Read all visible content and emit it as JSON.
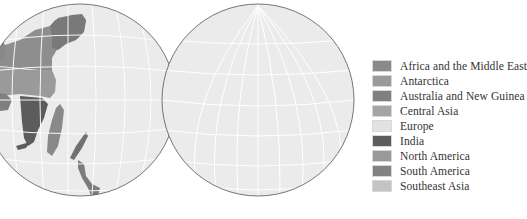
{
  "figure": {
    "left_globe": {
      "name": "Eastern hemisphere globe",
      "cx": 80,
      "cy": 100,
      "r": 96
    },
    "right_globe": {
      "name": "Western hemisphere globe",
      "cx": 258,
      "cy": 100,
      "r": 96
    },
    "globe_fill": "#ebebeb",
    "graticule_color": "#ffffff",
    "outline_color": "#555555"
  },
  "legend": {
    "items": [
      {
        "label": "Africa and the Middle East",
        "color": "#8a8a8a"
      },
      {
        "label": "Antarctica",
        "color": "#9a9a9a"
      },
      {
        "label": "Australia and New Guinea",
        "color": "#808080"
      },
      {
        "label": "Central Asia",
        "color": "#a4a4a4"
      },
      {
        "label": "Europe",
        "color": "#e2e2e2"
      },
      {
        "label": "India",
        "color": "#5c5c5c"
      },
      {
        "label": "North America",
        "color": "#999999"
      },
      {
        "label": "South America",
        "color": "#828282"
      },
      {
        "label": "Southeast Asia",
        "color": "#c4c4c4"
      }
    ]
  }
}
